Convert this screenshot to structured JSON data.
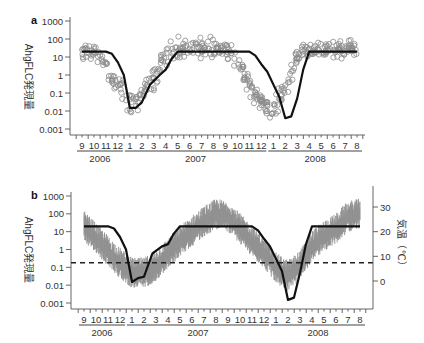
{
  "figure": {
    "panels": [
      {
        "id": "a",
        "label": "a",
        "ylabel": "AhgFLC発現量",
        "yticks": [
          "1000",
          "100",
          "10",
          "1",
          "0.1",
          "0.01",
          "0.001"
        ],
        "months": [
          "9",
          "10",
          "11",
          "12",
          "1",
          "2",
          "3",
          "4",
          "5",
          "6",
          "7",
          "8",
          "9",
          "10",
          "11",
          "12",
          "1",
          "2",
          "3",
          "4",
          "5",
          "6",
          "7",
          "8"
        ],
        "years": [
          "2006",
          "2007",
          "2008"
        ]
      },
      {
        "id": "b",
        "label": "b",
        "ylabel": "AhgFLC発現量",
        "yticks": [
          "1000",
          "100",
          "10",
          "1",
          "0.1",
          "0.01",
          "0.001"
        ],
        "right_ylabel": "気温（℃）",
        "right_yticks": [
          "30",
          "20",
          "10",
          "0"
        ],
        "months": [
          "9",
          "10",
          "11",
          "12",
          "1",
          "2",
          "3",
          "4",
          "5",
          "6",
          "7",
          "8",
          "9",
          "10",
          "11",
          "12",
          "1",
          "2",
          "3",
          "4",
          "5",
          "6",
          "7",
          "8"
        ],
        "years": [
          "2006",
          "2007",
          "2008"
        ]
      }
    ]
  },
  "colors": {
    "scatter": "#8a8a8a",
    "model_line": "#111111",
    "temperature_band": "#8f8f8f",
    "threshold": "#222222",
    "axis": "#555555"
  },
  "chart_data": [
    {
      "type": "scatter",
      "title": "a",
      "xlabel": "",
      "ylabel": "AhgFLC発現量",
      "yscale": "log",
      "ylim": [
        0.001,
        1000
      ],
      "xlim_months": [
        "2006-09",
        "2008-08"
      ],
      "x_ticks": [
        "9",
        "10",
        "11",
        "12",
        "1",
        "2",
        "3",
        "4",
        "5",
        "6",
        "7",
        "8",
        "9",
        "10",
        "11",
        "12",
        "1",
        "2",
        "3",
        "4",
        "5",
        "6",
        "7",
        "8"
      ],
      "year_groups": [
        {
          "year": "2006",
          "months": [
            "9",
            "10",
            "11",
            "12"
          ]
        },
        {
          "year": "2007",
          "months": [
            "1",
            "2",
            "3",
            "4",
            "5",
            "6",
            "7",
            "8",
            "9",
            "10",
            "11",
            "12"
          ]
        },
        {
          "year": "2008",
          "months": [
            "1",
            "2",
            "3",
            "4",
            "5",
            "6",
            "7",
            "8"
          ]
        }
      ],
      "series": [
        {
          "name": "observed (open circles)",
          "kind": "scatter",
          "envelope_by_month_index": {
            "x": [
              0,
              0.5,
              1,
              1.5,
              2,
              2.5,
              3,
              3.5,
              4,
              4.5,
              5,
              5.5,
              6,
              6.5,
              7,
              7.5,
              8,
              9,
              10,
              11,
              12,
              12.5,
              13,
              13.5,
              14,
              14.5,
              15,
              15.5,
              16,
              16.5,
              17,
              17.5,
              18,
              18.5,
              19,
              20,
              21,
              22,
              23
            ],
            "center": [
              20,
              20,
              20,
              15,
              3,
              0.8,
              0.3,
              0.08,
              0.02,
              0.03,
              0.08,
              0.3,
              0.8,
              2,
              8,
              20,
              25,
              30,
              30,
              30,
              25,
              15,
              5,
              1.5,
              0.4,
              0.1,
              0.03,
              0.01,
              0.01,
              0.05,
              0.3,
              2,
              12,
              25,
              25,
              30,
              30,
              30,
              25
            ],
            "spread_log10": [
              0.35,
              0.35,
              0.35,
              0.45,
              0.6,
              0.6,
              0.6,
              0.6,
              0.6,
              0.6,
              0.6,
              0.6,
              0.6,
              0.6,
              0.5,
              0.5,
              0.5,
              0.5,
              0.5,
              0.5,
              0.45,
              0.5,
              0.6,
              0.6,
              0.6,
              0.6,
              0.6,
              0.6,
              0.6,
              0.6,
              0.6,
              0.6,
              0.5,
              0.4,
              0.4,
              0.4,
              0.4,
              0.4,
              0.4
            ]
          }
        },
        {
          "name": "model (line)",
          "kind": "line",
          "x_month_index": [
            0,
            2,
            2.5,
            3,
            3.5,
            4.0,
            4.5,
            5.0,
            5.7,
            6.5,
            7.0,
            7.5,
            8.0,
            14.0,
            14.5,
            15.0,
            15.5,
            16.0,
            16.5,
            17.0,
            17.5,
            18.0,
            18.5,
            19.0,
            23.0
          ],
          "y": [
            20,
            20,
            15,
            5,
            1,
            0.015,
            0.015,
            0.03,
            0.3,
            1,
            2,
            8,
            20,
            20,
            12,
            4,
            1.5,
            0.3,
            0.06,
            0.004,
            0.005,
            0.05,
            2,
            20,
            20
          ]
        }
      ]
    },
    {
      "type": "line",
      "title": "b",
      "xlabel": "",
      "ylabel": "AhgFLC発現量",
      "yscale": "log",
      "ylim": [
        0.001,
        1000
      ],
      "right_ylabel": "気温（℃）",
      "right_ylim": [
        -5,
        36
      ],
      "right_yticks": [
        0,
        10,
        20,
        30
      ],
      "x_ticks": [
        "9",
        "10",
        "11",
        "12",
        "1",
        "2",
        "3",
        "4",
        "5",
        "6",
        "7",
        "8",
        "9",
        "10",
        "11",
        "12",
        "1",
        "2",
        "3",
        "4",
        "5",
        "6",
        "7",
        "8"
      ],
      "year_groups": [
        {
          "year": "2006",
          "months": [
            "9",
            "10",
            "11",
            "12"
          ]
        },
        {
          "year": "2007",
          "months": [
            "1",
            "2",
            "3",
            "4",
            "5",
            "6",
            "7",
            "8",
            "9",
            "10",
            "11",
            "12"
          ]
        },
        {
          "year": "2008",
          "months": [
            "1",
            "2",
            "3",
            "4",
            "5",
            "6",
            "7",
            "8"
          ]
        }
      ],
      "series": [
        {
          "name": "temperature (gray band, right axis, °C)",
          "kind": "band",
          "x_month_index": [
            0,
            1,
            2,
            3,
            4,
            5,
            6,
            7,
            8,
            9,
            10,
            11,
            12,
            13,
            14,
            15,
            16,
            17,
            18,
            19,
            20,
            21,
            22,
            23
          ],
          "center": [
            22,
            17,
            12,
            7,
            3,
            3,
            6,
            11,
            16,
            20,
            24,
            27,
            26,
            21,
            16,
            11,
            5,
            2,
            6,
            14,
            18,
            21,
            26,
            27
          ],
          "half_range": [
            5,
            5,
            5,
            5,
            5,
            5,
            5,
            5,
            5,
            5,
            5,
            5,
            5,
            5,
            5,
            5,
            5,
            5,
            5,
            5,
            5,
            5,
            5,
            5
          ]
        },
        {
          "name": "model AhgFLC (line, left axis)",
          "kind": "line",
          "x_month_index": [
            0,
            2,
            2.5,
            3,
            3.5,
            4.0,
            4.5,
            5.0,
            5.7,
            6.5,
            7.0,
            7.5,
            8.0,
            14.0,
            14.5,
            15.0,
            15.5,
            16.0,
            16.5,
            17.0,
            17.5,
            18.0,
            18.5,
            19.0,
            23.0
          ],
          "y": [
            20,
            20,
            15,
            5,
            1,
            0.015,
            0.025,
            0.03,
            0.6,
            1.5,
            2,
            8,
            20,
            20,
            12,
            4,
            1.5,
            0.3,
            0.06,
            0.0015,
            0.002,
            0.05,
            2,
            20,
            20
          ]
        },
        {
          "name": "threshold (dashed)",
          "kind": "hline",
          "y": 0.18,
          "right_axis_equivalent_c": 11
        }
      ]
    }
  ]
}
